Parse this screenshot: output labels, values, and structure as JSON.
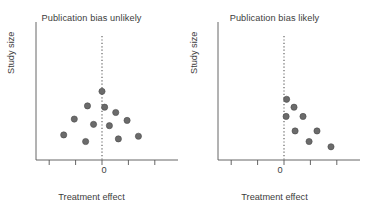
{
  "figure": {
    "background": "#ffffff",
    "axis_color": "#555555",
    "point_color": "#6b6b6b",
    "point_stroke": "#4a4a4a",
    "text_color": "#3c3c3c",
    "dotted_line_color": "#555555"
  },
  "chart_data": [
    {
      "type": "scatter",
      "title": "Publication bias unlikely",
      "xlabel": "Treatment effect",
      "ylabel": "Study size",
      "grid": false,
      "legend": null,
      "xlim": [
        -2.5,
        2.5
      ],
      "ylim": [
        0,
        10
      ],
      "xticks": [
        -2,
        -1,
        0,
        1,
        2
      ],
      "xticklabels": [
        "",
        "",
        "0",
        "",
        ""
      ],
      "yticks": [],
      "yticklabels": [],
      "reference_line": {
        "orientation": "vertical",
        "x": 0,
        "style": "dotted"
      },
      "points": [
        {
          "x": 0.0,
          "y": 5.2
        },
        {
          "x": -0.55,
          "y": 4.1
        },
        {
          "x": 0.1,
          "y": 4.0
        },
        {
          "x": 0.52,
          "y": 3.6
        },
        {
          "x": -1.05,
          "y": 3.1
        },
        {
          "x": -0.32,
          "y": 2.7
        },
        {
          "x": 0.28,
          "y": 2.6
        },
        {
          "x": 0.95,
          "y": 3.0
        },
        {
          "x": -1.45,
          "y": 1.9
        },
        {
          "x": -0.62,
          "y": 1.4
        },
        {
          "x": 0.62,
          "y": 1.6
        },
        {
          "x": 1.38,
          "y": 1.8
        }
      ]
    },
    {
      "type": "scatter",
      "title": "Publication bias likely",
      "xlabel": "Treatment effect",
      "ylabel": "Study size",
      "grid": false,
      "legend": null,
      "xlim": [
        -2.5,
        2.5
      ],
      "ylim": [
        0,
        10
      ],
      "xticks": [
        -2,
        -1,
        0,
        1,
        2
      ],
      "xticklabels": [
        "",
        "",
        "0",
        "",
        ""
      ],
      "yticks": [],
      "yticklabels": [],
      "reference_line": {
        "orientation": "vertical",
        "x": 0,
        "style": "dotted"
      },
      "points": [
        {
          "x": 0.1,
          "y": 4.6
        },
        {
          "x": 0.38,
          "y": 4.0
        },
        {
          "x": 0.08,
          "y": 3.3
        },
        {
          "x": 0.72,
          "y": 3.3
        },
        {
          "x": 0.42,
          "y": 2.2
        },
        {
          "x": 1.25,
          "y": 2.2
        },
        {
          "x": 0.95,
          "y": 1.4
        },
        {
          "x": 1.78,
          "y": 1.0
        }
      ]
    }
  ],
  "panels": [
    {
      "name": "left",
      "title": "Publication bias unlikely",
      "xlabel": "Treatment effect",
      "ylabel": "Study size",
      "zero_label": "0"
    },
    {
      "name": "right",
      "title": "Publication bias likely",
      "xlabel": "Treatment effect",
      "ylabel": "Study size",
      "zero_label": "0"
    }
  ]
}
